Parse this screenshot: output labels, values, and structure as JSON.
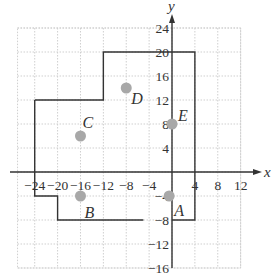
{
  "figure": {
    "x_axis_label": "x",
    "y_axis_label": "y",
    "x_ticks": [
      -24,
      -20,
      -16,
      -12,
      -8,
      -4,
      4,
      8,
      12
    ],
    "x_tick_labels": [
      "−24",
      "−20",
      "−16",
      "−12",
      "−8",
      "−4",
      "4",
      "8",
      "12"
    ],
    "y_ticks": [
      24,
      20,
      16,
      12,
      8,
      4,
      -4,
      -8,
      -12,
      -16
    ],
    "y_tick_labels": [
      "24",
      "20",
      "16",
      "12",
      "8",
      "4",
      "−4",
      "−8",
      "−12",
      "−16"
    ],
    "grid": {
      "x_min": -27,
      "x_max": 12,
      "y_min": -16,
      "y_max": 24,
      "step": 4
    },
    "points": [
      {
        "label": "A",
        "x": -0.5,
        "y": -4
      },
      {
        "label": "B",
        "x": -16,
        "y": -4
      },
      {
        "label": "C",
        "x": -16,
        "y": 6
      },
      {
        "label": "D",
        "x": -8,
        "y": 14
      },
      {
        "label": "E",
        "x": 0,
        "y": 8
      }
    ],
    "boundary_upper": [
      [
        -24,
        12
      ],
      [
        -12,
        12
      ],
      [
        -12,
        20
      ],
      [
        4,
        20
      ],
      [
        4,
        -8
      ],
      [
        0,
        -8
      ]
    ],
    "boundary_lower": [
      [
        -24,
        12
      ],
      [
        -24,
        -4
      ],
      [
        -20,
        -4
      ],
      [
        -20,
        -8
      ],
      [
        -5,
        -8
      ]
    ],
    "colors": {
      "point": "#a8a8a8",
      "line": "#333333",
      "grid": "#cfcfcf"
    }
  }
}
